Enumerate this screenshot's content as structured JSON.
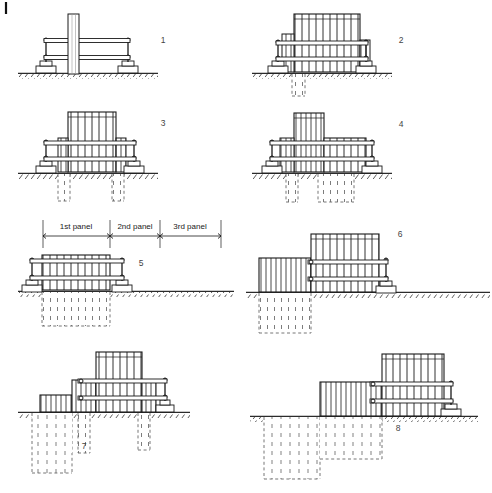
{
  "figure": {
    "corner_mark": "|",
    "background_color": "#ffffff",
    "ink_color": "#1a1a1a",
    "ground_color": "#2b2b2b",
    "dashed_color": "#555555"
  },
  "dimension_strip": {
    "labels": [
      {
        "text": "1st panel"
      },
      {
        "text": "2nd panel"
      },
      {
        "text": "3rd panel"
      }
    ]
  },
  "panels": [
    {
      "number": "1",
      "label_x": 163,
      "label_y": 43,
      "caption": "Guide wall set, trench start"
    },
    {
      "number": "2",
      "label_x": 401,
      "label_y": 43,
      "caption": "Reinforcement cage lowered into 1st panel"
    },
    {
      "number": "3",
      "label_x": 163,
      "label_y": 126,
      "caption": "Cage seated, tremie pipes placed"
    },
    {
      "number": "4",
      "label_x": 401,
      "label_y": 127,
      "caption": "Concreting of 1st panel by tremie"
    },
    {
      "number": "5",
      "label_x": 141,
      "label_y": 266,
      "caption": "1st panel complete, excavation of 2nd panel"
    },
    {
      "number": "6",
      "label_x": 400,
      "label_y": 237,
      "caption": "2nd panel excavated alongside cast 1st panel"
    },
    {
      "number": "7",
      "label_x": 84,
      "label_y": 449,
      "caption": "2nd panel cage and concreting"
    },
    {
      "number": "8",
      "label_x": 398,
      "label_y": 431,
      "caption": "3rd panel excavation, wall continues"
    }
  ]
}
